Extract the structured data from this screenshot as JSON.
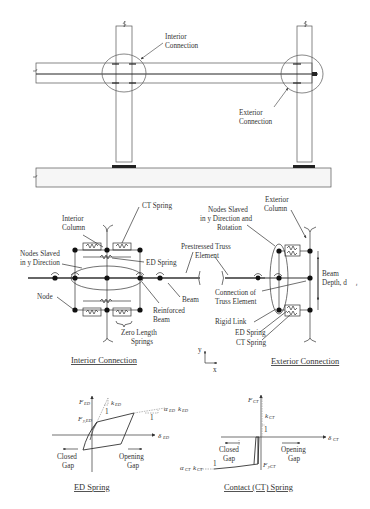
{
  "frame": {
    "labels": {
      "interior_connection": [
        "Interior",
        "Connection"
      ],
      "exterior_connection": [
        "Exterior",
        "Connection"
      ]
    }
  },
  "interior": {
    "caption": "Interior Connection",
    "labels": {
      "ct_spring": "CT Spring",
      "interior_column": [
        "Interior",
        "Column"
      ],
      "nodes_slaved": [
        "Nodes Slaved",
        "in y Direction"
      ],
      "ed_spring": "ED Spring",
      "node": "Node",
      "reinforced_beam": [
        "Reinforced",
        "Beam"
      ],
      "beam": "Beam",
      "zero_length_springs": [
        "Zero Length",
        "Springs"
      ]
    }
  },
  "exterior": {
    "caption": "Exterior Connection",
    "labels": {
      "exterior_column": [
        "Exterior",
        "Column"
      ],
      "nodes_slaved": [
        "Nodes Slaved",
        "in y Direction and",
        "Rotation"
      ],
      "prestressed_truss": [
        "Prestressed Truss",
        "Element"
      ],
      "connection_truss": [
        "Connection of",
        "Truss Element"
      ],
      "beam_depth": [
        "Beam",
        "Depth, d"
      ],
      "beam_depth_sub": "t",
      "rigid_link": "Rigid Link",
      "ed_spring": "ED Spring",
      "ct_spring": "CT Spring"
    }
  },
  "axes_indicator": {
    "y": "y",
    "x": "x"
  },
  "ed_spring_plot": {
    "caption": "ED Spring",
    "labels": {
      "force": "F",
      "force_sub": "ED",
      "yield": "F",
      "yield_sub": "y,ED",
      "stiffness": "k",
      "stiffness_sub": "ED",
      "post_yield": "α",
      "post_yield_sub": "ED",
      "post_yield_k": "k",
      "post_yield_k_sub": "ED",
      "disp": "δ",
      "disp_sub": "ED",
      "slope_one_a": "1",
      "slope_one_b": "1",
      "closed_gap": [
        "Closed",
        "Gap"
      ],
      "opening_gap": [
        "Opening",
        "Gap"
      ]
    }
  },
  "ct_spring_plot": {
    "caption": "Contact (CT) Spring",
    "labels": {
      "force": "F",
      "force_sub": "CT",
      "stiffness": "k",
      "stiffness_sub": "CT",
      "yield": "F",
      "yield_sub": "yCT",
      "post_yield": "α",
      "post_yield_sub": "CT",
      "post_yield_k": "k",
      "post_yield_k_sub": "CT",
      "disp": "δ",
      "disp_sub": "CT",
      "slope_one_a": "1",
      "slope_one_b": "1",
      "closed_gap": [
        "Closed",
        "Gap"
      ],
      "opening_gap": [
        "Opening",
        "Gap"
      ]
    }
  },
  "colors": {
    "line": "#333333",
    "light": "#888888",
    "foundation": "#f6f6f6"
  }
}
